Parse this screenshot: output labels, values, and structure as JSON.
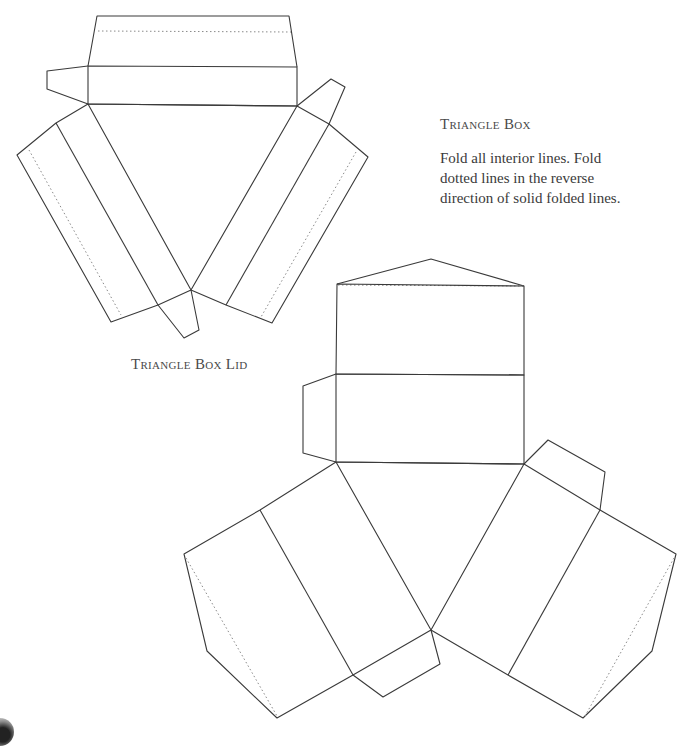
{
  "page": {
    "title": "Triangle Box",
    "instructions": "Fold all interior lines. Fold dotted lines in the reverse direction of solid folded lines.",
    "lid_caption": "Triangle Box Lid"
  },
  "colors": {
    "cut_line": "#3a3a3a",
    "dotted_line": "#8a8a8a",
    "text": "#4a4a4a",
    "background": "#ffffff"
  },
  "nets": [
    {
      "name": "triangle-box-lid",
      "legend": "solid = cut/fold, dotted = reverse fold"
    },
    {
      "name": "triangle-box",
      "legend": "solid = cut/fold, dotted = reverse fold"
    }
  ]
}
